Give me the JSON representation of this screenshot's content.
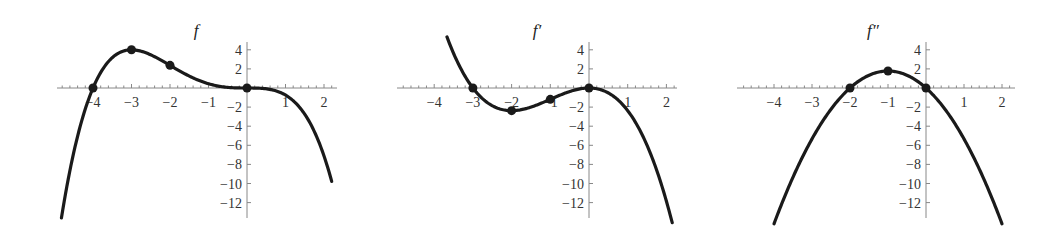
{
  "chart_data": [
    {
      "type": "line",
      "title": "f",
      "xlabel": "",
      "ylabel": "",
      "xlim": [
        -5,
        2.3
      ],
      "ylim": [
        -13.9,
        4.8
      ],
      "x_ticks": [
        -4,
        -3,
        -2,
        -1,
        1,
        2
      ],
      "y_ticks": [
        4,
        2,
        -2,
        -4,
        -6,
        -8,
        -10,
        -12
      ],
      "grid": false,
      "formula": "-x^3 (x+4) / 6.75",
      "x_range": [
        -4.82,
        2.2
      ],
      "marked_points": [
        [
          -4,
          0
        ],
        [
          -3,
          4
        ],
        [
          -2,
          2.37
        ],
        [
          0,
          0
        ]
      ],
      "layout": {
        "x0": 247,
        "y0": 88,
        "sx": 38.5,
        "sy": 9.55,
        "axis_x": [
          57,
          337
        ],
        "axis_y": [
          42,
          218
        ],
        "title_x": 196,
        "title_y": 36
      }
    },
    {
      "type": "line",
      "title": "f′",
      "xlabel": "",
      "ylabel": "",
      "xlim": [
        -5,
        2.3
      ],
      "ylim": [
        -13.9,
        4.8
      ],
      "x_ticks": [
        -4,
        -3,
        -2,
        -1,
        1,
        2
      ],
      "y_ticks": [
        4,
        2,
        -2,
        -4,
        -6,
        -8,
        -10,
        -12
      ],
      "grid": false,
      "formula": "-4 x^2 (x+3) / 6.75",
      "x_range": [
        -3.67,
        2.15
      ],
      "marked_points": [
        [
          -3,
          0
        ],
        [
          -2,
          -2.37
        ],
        [
          -1,
          -1.19
        ],
        [
          0,
          0
        ]
      ],
      "layout": {
        "x0": 589,
        "y0": 88,
        "sx": 38.7,
        "sy": 9.55,
        "axis_x": [
          397,
          677
        ],
        "axis_y": [
          42,
          218
        ],
        "title_x": 537,
        "title_y": 36
      }
    },
    {
      "type": "line",
      "title": "f″",
      "xlabel": "",
      "ylabel": "",
      "xlim": [
        -5,
        2.3
      ],
      "ylim": [
        -13.9,
        4.8
      ],
      "x_ticks": [
        -4,
        -3,
        -2,
        -1,
        1,
        2
      ],
      "y_ticks": [
        4,
        2,
        -2,
        -4,
        -6,
        -8,
        -10,
        -12
      ],
      "grid": false,
      "formula": "-12 x (x+2) / 6.75",
      "x_range": [
        -4.0,
        2.0
      ],
      "marked_points": [
        [
          -2,
          0
        ],
        [
          -1,
          1.78
        ],
        [
          0,
          0
        ]
      ],
      "layout": {
        "x0": 926,
        "y0": 88,
        "sx": 38.0,
        "sy": 9.55,
        "axis_x": [
          737,
          1015
        ],
        "axis_y": [
          42,
          218
        ],
        "title_x": 873,
        "title_y": 36
      }
    }
  ]
}
